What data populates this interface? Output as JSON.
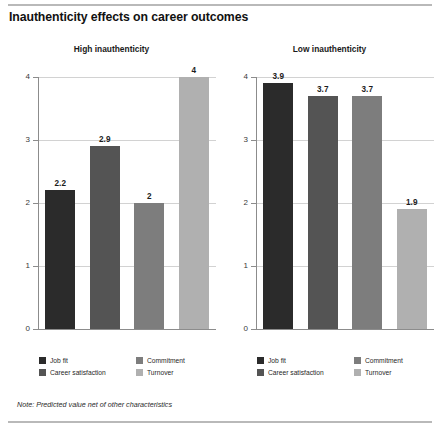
{
  "title": "Inauthenticity effects on career outcomes",
  "note": "Note: Predicted value net of other characteristics",
  "legend": {
    "items": [
      {
        "label": "Job fit",
        "color": "#2b2b2b"
      },
      {
        "label": "Commitment",
        "color": "#7d7d7d"
      },
      {
        "label": "Career satisfaction",
        "color": "#545454"
      },
      {
        "label": "Turnover",
        "color": "#b0b0b0"
      }
    ]
  },
  "chart_data": {
    "type": "bar",
    "title": "Inauthenticity effects on career outcomes",
    "xlabel": "",
    "ylabel": "",
    "ylim": [
      0,
      4
    ],
    "yticks": [
      0,
      1,
      2,
      3,
      4
    ],
    "ytick_labels": [
      "0",
      "1",
      "2",
      "3",
      "4"
    ],
    "grid": true,
    "legend_position": "bottom",
    "categories": [
      "Job fit",
      "Career satisfaction",
      "Commitment",
      "Turnover"
    ],
    "colors": [
      "#2b2b2b",
      "#545454",
      "#7d7d7d",
      "#b0b0b0"
    ],
    "panels": [
      {
        "subtitle": "High inauthenticity",
        "values": [
          2.2,
          2.9,
          2,
          4
        ],
        "value_labels": [
          "2.2",
          "2.9",
          "2",
          "4"
        ]
      },
      {
        "subtitle": "Low inauthenticity",
        "values": [
          3.9,
          3.7,
          3.7,
          1.9
        ],
        "value_labels": [
          "3.9",
          "3.7",
          "3.7",
          "1.9"
        ]
      }
    ]
  }
}
